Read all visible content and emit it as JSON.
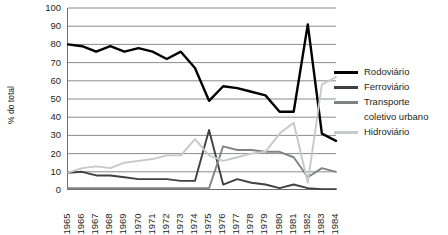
{
  "chart_data": {
    "type": "line",
    "title": "",
    "xlabel": "",
    "ylabel": "% do total",
    "ylim": [
      0,
      100
    ],
    "ytick_step": 10,
    "yticks": [
      0,
      10,
      20,
      30,
      40,
      50,
      60,
      70,
      80,
      90,
      100
    ],
    "grid": true,
    "grid_axis": "y",
    "legend_position": "right",
    "categories": [
      "1965",
      "1966",
      "1967",
      "1968",
      "1969",
      "1970",
      "1971",
      "1972",
      "1973",
      "1974",
      "1975",
      "1976",
      "1977",
      "1978",
      "1979",
      "1980",
      "1981",
      "1982",
      "1983",
      "1984"
    ],
    "series": [
      {
        "name": "Rodoviário",
        "color": "#000000",
        "values": [
          80,
          79,
          76,
          79,
          76,
          78,
          76,
          72,
          76,
          67,
          49,
          57,
          56,
          54,
          52,
          43,
          43,
          91,
          31,
          27
        ]
      },
      {
        "name": "Ferroviário",
        "color": "#404041",
        "values": [
          9.5,
          10,
          8,
          8,
          7,
          6,
          6,
          6,
          5,
          5,
          33,
          3,
          6,
          4,
          3,
          1,
          3,
          1,
          0.5,
          0.5
        ]
      },
      {
        "name": "Transporte coletivo urbano",
        "color": "#808285",
        "values": [
          1,
          1,
          1,
          1,
          1,
          1,
          1,
          1,
          1,
          1,
          1,
          24,
          22,
          22,
          21,
          21,
          18,
          7,
          12,
          10
        ]
      },
      {
        "name": "Hidroviário",
        "color": "#c7c8ca",
        "values": [
          9.5,
          12,
          13,
          12,
          15,
          16,
          17,
          19,
          19,
          28,
          19,
          16,
          18,
          20,
          21,
          31,
          37,
          4,
          58,
          62
        ]
      }
    ]
  },
  "legend": {
    "items": [
      {
        "label": "Rodoviário",
        "color": "#000000"
      },
      {
        "label": "Ferroviário",
        "color": "#404041"
      },
      {
        "label": "Transporte",
        "color": "#808285"
      },
      {
        "label": "coletivo urbano",
        "color": ""
      },
      {
        "label": "Hidroviário",
        "color": "#c7c8ca"
      }
    ]
  }
}
